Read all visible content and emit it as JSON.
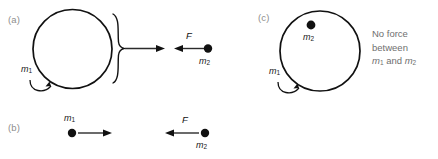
{
  "figure": {
    "background_color": "#ffffff",
    "ink_color": "#111111",
    "label_color": "#8d8d8d",
    "note_color": "#6f6f6f"
  },
  "panels": [
    {
      "id": "a",
      "label": "(a)",
      "shell_label": "m",
      "shell_label_sub": "1",
      "point_label": "m",
      "point_label_sub": "2",
      "force_label": "F",
      "description": "Spherical shell of mass m1 attracts external point mass m2"
    },
    {
      "id": "b",
      "label": "(b)",
      "left_label": "m",
      "left_label_sub": "1",
      "right_label": "m",
      "right_label_sub": "2",
      "force_label": "F",
      "description": "Two point masses attract each other"
    },
    {
      "id": "c",
      "label": "(c)",
      "shell_label": "m",
      "shell_label_sub": "1",
      "point_label": "m",
      "point_label_sub": "2",
      "description": "Point mass m2 inside shell m1 feels no net force"
    }
  ],
  "note": {
    "line1": "No force",
    "line2": "between",
    "line3_m1": "m",
    "line3_m1_sub": "1",
    "line3_and": " and ",
    "line3_m2": "m",
    "line3_m2_sub": "2"
  }
}
